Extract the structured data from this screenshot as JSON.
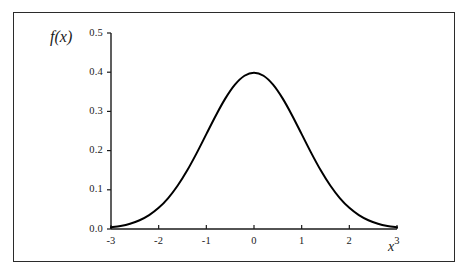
{
  "figure": {
    "border_color": "#2b2b2b",
    "background_color": "#ffffff"
  },
  "axis_labels": {
    "y": "f(x)",
    "x": "x"
  },
  "chart_data": {
    "type": "line",
    "title": "",
    "subtitle": "",
    "xlabel": "x",
    "ylabel": "f(x)",
    "xlim": [
      -3,
      3
    ],
    "ylim": [
      0.0,
      0.5
    ],
    "grid": false,
    "legend": null,
    "legend_position": "none",
    "line_color": "#000000",
    "line_width": 2,
    "xticks": [
      -3,
      -2,
      -1,
      0,
      1,
      2,
      3
    ],
    "xtick_labels": [
      "-3",
      "-2",
      "-1",
      "0",
      "1",
      "2",
      "3"
    ],
    "yticks": [
      0.0,
      0.1,
      0.2,
      0.3,
      0.4,
      0.5
    ],
    "ytick_labels": [
      "0.0",
      "0.1",
      "0.2",
      "0.3",
      "0.4",
      "0.5"
    ],
    "series": [
      {
        "name": "standard normal pdf",
        "x": [
          -3.0,
          -2.8,
          -2.6,
          -2.4,
          -2.2,
          -2.0,
          -1.8,
          -1.6,
          -1.4,
          -1.2,
          -1.0,
          -0.8,
          -0.6,
          -0.4,
          -0.2,
          0.0,
          0.2,
          0.4,
          0.6,
          0.8,
          1.0,
          1.2,
          1.4,
          1.6,
          1.8,
          2.0,
          2.2,
          2.4,
          2.6,
          2.8,
          3.0
        ],
        "values": [
          0.0044,
          0.0079,
          0.0136,
          0.0224,
          0.0355,
          0.054,
          0.079,
          0.1109,
          0.1497,
          0.1942,
          0.242,
          0.2897,
          0.3332,
          0.3683,
          0.391,
          0.3989,
          0.391,
          0.3683,
          0.3332,
          0.2897,
          0.242,
          0.1942,
          0.1497,
          0.1109,
          0.079,
          0.054,
          0.0355,
          0.0224,
          0.0136,
          0.0079,
          0.0044
        ]
      }
    ],
    "annotations": []
  }
}
